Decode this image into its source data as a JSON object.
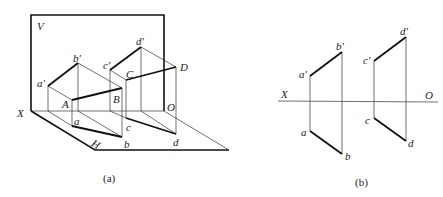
{
  "figure_a": {
    "caption": "(a)",
    "plane_labels": {
      "V": "V",
      "H": "H",
      "X": "X",
      "O": "O"
    },
    "points": {
      "a_prime": "a'",
      "b_prime": "b'",
      "c_prime": "c'",
      "d_prime": "d'",
      "A": "A",
      "B": "B",
      "C": "C",
      "D": "D",
      "a": "a",
      "b": "b",
      "c": "c",
      "d": "d"
    }
  },
  "figure_b": {
    "caption": "(b)",
    "axis_labels": {
      "X": "X",
      "O": "O"
    },
    "points": {
      "a_prime": "a'",
      "b_prime": "b'",
      "c_prime": "c'",
      "d_prime": "d'",
      "a": "a",
      "b": "b",
      "c": "c",
      "d": "d"
    }
  }
}
